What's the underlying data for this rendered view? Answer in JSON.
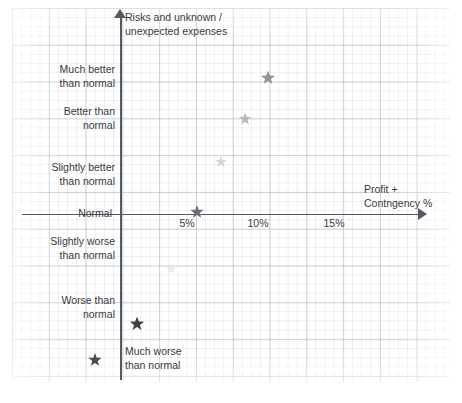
{
  "chart_data": {
    "type": "scatter",
    "title": "",
    "xlabel": "Profit + Contngency %",
    "ylabel": "Risks and unknown / unexpected expenses",
    "xlim": [
      0,
      19
    ],
    "ylim": [
      -3.5,
      3.5
    ],
    "grid": true,
    "legend": null,
    "x_ticks": [
      {
        "label": "5%",
        "value": 5
      },
      {
        "label": "10%",
        "value": 10
      },
      {
        "label": "15%",
        "value": 15
      }
    ],
    "y_categories": [
      {
        "label": "Much better\nthan normal",
        "value": 3
      },
      {
        "label": "Better than\nnormal",
        "value": 2
      },
      {
        "label": "Slightly better\nthan normal",
        "value": 1
      },
      {
        "label": "Normal",
        "value": 0
      },
      {
        "label": "Slightly worse\nthan normal",
        "value": -1
      },
      {
        "label": "Worse than\nnormal",
        "value": -2
      },
      {
        "label": "Much worse\nthan normal",
        "value": -3
      }
    ],
    "points": [
      {
        "name": "point-1",
        "x": 10.2,
        "y": 3.0,
        "marker": "star",
        "size": 15,
        "color": "#8c8f94",
        "opacity": 0.95
      },
      {
        "name": "point-2",
        "x": 8.6,
        "y": 2.1,
        "marker": "star",
        "size": 13,
        "color": "#a9acb1",
        "opacity": 0.8
      },
      {
        "name": "point-3",
        "x": 6.9,
        "y": 1.15,
        "marker": "star",
        "size": 12,
        "color": "#c3c6ca",
        "opacity": 0.7
      },
      {
        "name": "point-4",
        "x": 5.3,
        "y": 0.05,
        "marker": "star",
        "size": 14,
        "color": "#6c6f74",
        "opacity": 1.0
      },
      {
        "name": "point-5",
        "x": 3.5,
        "y": -1.2,
        "marker": "star",
        "size": 12,
        "color": "#e0e2e4",
        "opacity": 0.6
      },
      {
        "name": "point-6",
        "x": 1.1,
        "y": -2.4,
        "marker": "star",
        "size": 15,
        "color": "#3c3f44",
        "opacity": 1.0
      },
      {
        "name": "point-7",
        "x": -1.8,
        "y": -3.2,
        "marker": "star",
        "size": 14,
        "color": "#4a4d52",
        "opacity": 1.0
      }
    ],
    "axis_style": {
      "color": "#555a60",
      "arrow_x": true,
      "arrow_y": true
    }
  },
  "axes": {
    "y_title": "Risks and unknown /\nunexpected expenses",
    "x_title": "Profit +\nContngency %"
  },
  "y_labels": {
    "much_better": "Much better\nthan normal",
    "better": "Better than\nnormal",
    "slightly_better": "Slightly better\nthan normal",
    "normal": "Normal",
    "slightly_worse": "Slightly worse\nthan normal",
    "worse": "Worse than\nnormal",
    "much_worse": "Much worse\nthan normal"
  },
  "x_labels": {
    "t5": "5%",
    "t10": "10%",
    "t15": "15%"
  },
  "caption": "",
  "colors": {
    "axis": "#555a60",
    "grid_minor": "#aab4c3",
    "grid_major": "#96a2b4",
    "text": "#3a3a3a"
  }
}
